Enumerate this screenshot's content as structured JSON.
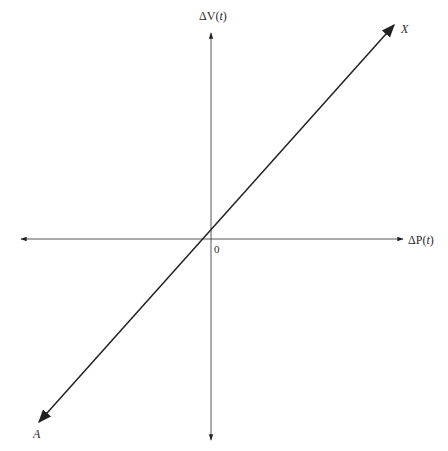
{
  "diagram": {
    "title": "",
    "axes": {
      "vertical": {
        "label_prefix": "ΔV(",
        "label_var": "t",
        "label_suffix": ")",
        "label": "ΔV(t)"
      },
      "horizontal": {
        "label_prefix": "ΔP(",
        "label_var": "t",
        "label_suffix": ")",
        "label": "ΔP(t)"
      },
      "origin_label": "0"
    },
    "line": {
      "upper_end_label": "X",
      "lower_end_label": "A",
      "description": "Straight line through origin with positive slope, arrows at both ends"
    },
    "colors": {
      "stroke": "#333333",
      "text": "#2a2a2a",
      "background": "#ffffff"
    }
  }
}
